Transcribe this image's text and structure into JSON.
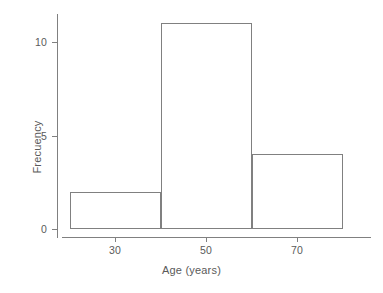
{
  "chart_data": {
    "type": "bar",
    "title": "",
    "subtitle": "",
    "xlabel": "Age (years)",
    "ylabel": "Frecuency",
    "xlim": [
      16,
      84
    ],
    "ylim": [
      0,
      11.6
    ],
    "grid": false,
    "legend": null,
    "bin_edges": [
      20,
      40,
      60,
      80
    ],
    "bin_width": 20,
    "categories": [
      "20-40",
      "40-60",
      "60-80"
    ],
    "values": [
      2,
      11,
      4
    ],
    "bars": [
      {
        "label": "20-40",
        "x_start": 20,
        "x_end": 40,
        "value": 2
      },
      {
        "label": "40-60",
        "x_start": 40,
        "x_end": 60,
        "value": 11
      },
      {
        "label": "60-80",
        "x_start": 60,
        "x_end": 80,
        "value": 4
      }
    ],
    "x_ticks": [
      {
        "value": 30,
        "label": "30"
      },
      {
        "value": 50,
        "label": "50"
      },
      {
        "value": 70,
        "label": "70"
      }
    ],
    "y_ticks": [
      {
        "value": 0,
        "label": "0"
      },
      {
        "value": 5,
        "label": "5"
      },
      {
        "value": 10,
        "label": "10"
      }
    ],
    "colors": {
      "bar_stroke": "#808080",
      "bar_fill": "transparent",
      "axis": "#808080",
      "text": "#5a5a5a",
      "background": "#ffffff"
    }
  }
}
